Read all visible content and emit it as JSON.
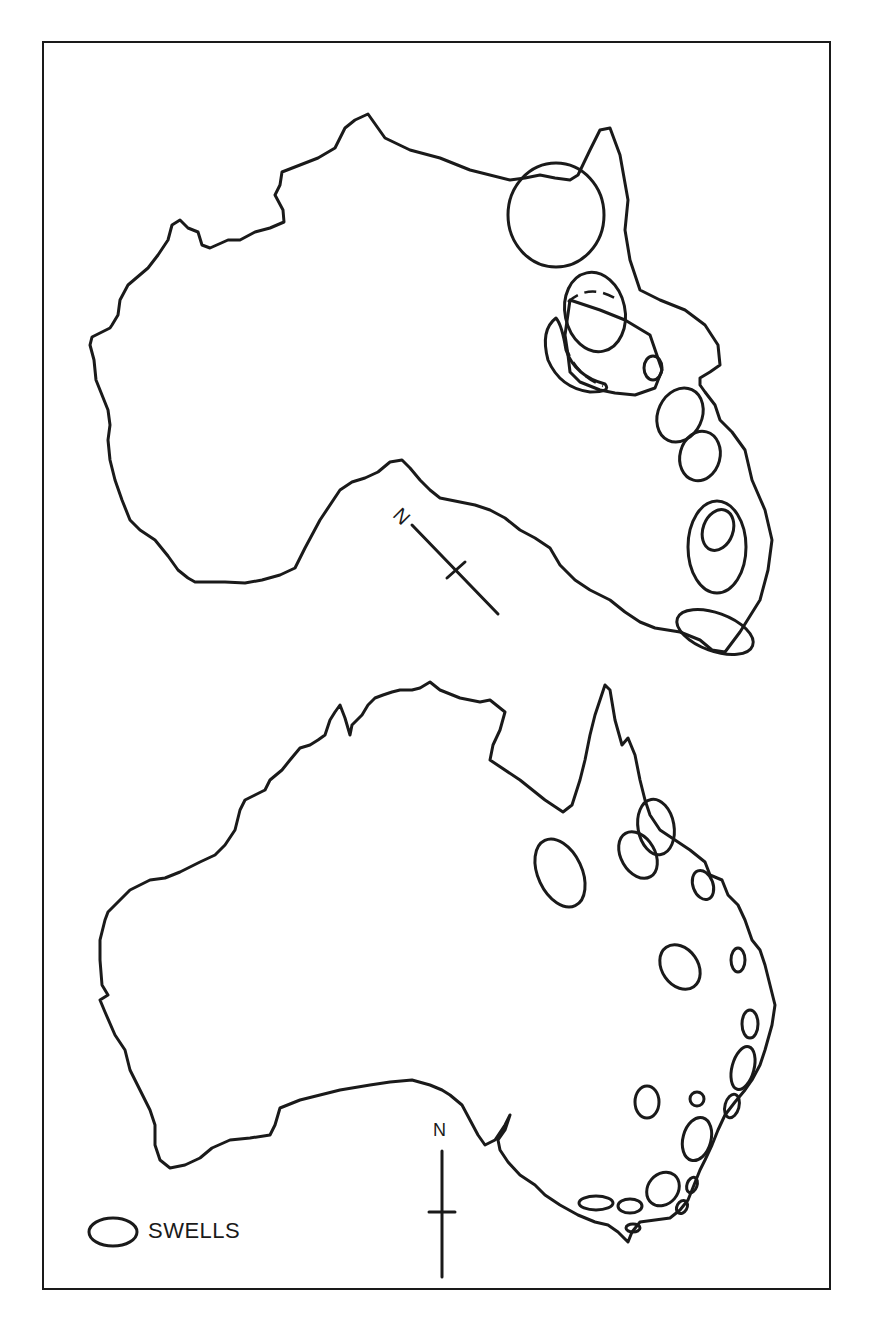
{
  "figure": {
    "type": "map-diagram",
    "panels": [
      {
        "id": "top",
        "description": "Australian continent rotated/distorted outline with swells and rotated north arrow",
        "north_arrow": {
          "label": "N",
          "orientation": "rotated ~45deg"
        }
      },
      {
        "id": "bottom",
        "description": "Present-day Australia outline with swells",
        "north_arrow": {
          "label": "N",
          "orientation": "vertical"
        }
      }
    ],
    "legend": {
      "items": [
        {
          "symbol": "ellipse-outline",
          "label": "SWELLS"
        }
      ]
    },
    "colors": {
      "ink": "#1a1a1a",
      "background": "#ffffff"
    }
  }
}
